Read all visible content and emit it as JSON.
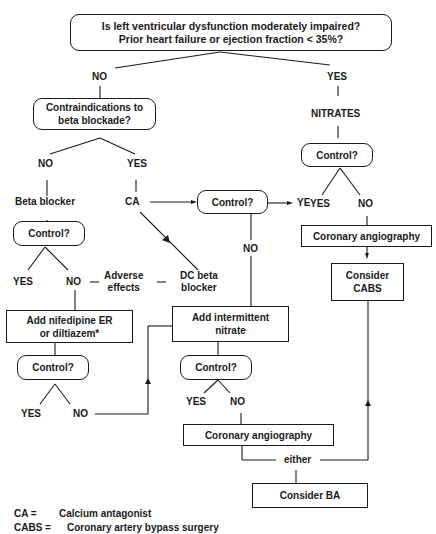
{
  "nodes": {
    "q_lv": {
      "line1": "Is left ventricular dysfunction moderately impaired?",
      "line2": "Prior heart failure or ejection fraction < 35%?"
    },
    "q_contra": {
      "line1": "Contraindications to",
      "line2": "beta blockade?"
    },
    "control_bb": "Control?",
    "control_ca": "Control?",
    "control_nitrates": "Control?",
    "add_nifedipine": {
      "line1": "Add nifedipine ER",
      "line2": "or diltiazem*"
    },
    "control_nif": "Control?",
    "add_nitrate": {
      "line1": "Add  intermittent",
      "line2": "nitrate"
    },
    "control_nitrate2": "Control?",
    "angio_right": "Coronary angiography",
    "consider_cabs": {
      "line1": "Consider",
      "line2": "CABS"
    },
    "angio_center": "Coronary angiography",
    "consider_ba": "Consider BA"
  },
  "labels": {
    "no_top": "NO",
    "yes_top": "YES",
    "nitrates": "NITRATES",
    "no_contra": "NO",
    "yes_contra": "YES",
    "beta_blocker": "Beta blocker",
    "ca": "CA",
    "yes_ca": "YES",
    "no_ca": "NO",
    "yes_nitrates": "YES",
    "no_nitrates": "NO",
    "yes_bb": "YES",
    "no_bb": "NO",
    "adverse": {
      "line1": "Adverse",
      "line2": "effects"
    },
    "dc_beta": {
      "line1": "DC beta",
      "line2": "blocker"
    },
    "yes_nif": "YES",
    "no_nif": "NO",
    "yes_nitrate2": "YES",
    "no_nitrate2": "NO",
    "either": "either"
  },
  "legend": [
    {
      "abbr": "CA =",
      "meaning": "Calcium antagonist"
    },
    {
      "abbr": "CABS =",
      "meaning": "Coronary artery bypass surgery"
    }
  ],
  "colors": {
    "ink": "#1a1a1a",
    "background": "#ffffff"
  }
}
